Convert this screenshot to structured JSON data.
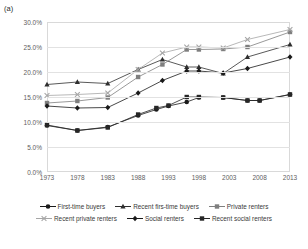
{
  "panel": {
    "label": "(a)"
  },
  "colors": {
    "series_first_time_buyers": "#1a1a1a",
    "series_recent_first_time_buyers": "#2e2e2e",
    "series_private_renters": "#7f7f7f",
    "series_recent_private_renters": "#a6a6a6",
    "series_social_renters": "#1a1a1a",
    "series_recent_social_renters": "#262626",
    "gridline": "#e2e2e2",
    "axis_text": "#5e5e5e",
    "plot_border": "#d9d9d9"
  },
  "chart_data": {
    "type": "line",
    "title": "",
    "subtitle": "",
    "xlabel": "",
    "ylabel": "",
    "grid": true,
    "legend_position": "bottom",
    "xlim": [
      1973,
      2013
    ],
    "ylim": [
      0,
      30
    ],
    "y_tick_labels": [
      "30.0%",
      "25.0%",
      "20.0%",
      "15.0%",
      "10.0%",
      "5.0%",
      "0.0%"
    ],
    "y_ticks": [
      30,
      25,
      20,
      15,
      10,
      5,
      0
    ],
    "x_tick_labels": [
      "1973",
      "1978",
      "1983",
      "1988",
      "1993",
      "1998",
      "2003",
      "2008",
      "2013"
    ],
    "x_ticks": [
      1973,
      1978,
      1983,
      1988,
      1993,
      1998,
      2003,
      2008,
      2013
    ],
    "series": [
      {
        "name": "First-time buyers",
        "marker": "circle",
        "color": "#1a1a1a",
        "x": [
          1973,
          1978,
          1983,
          1988,
          1991,
          1993,
          1996,
          1998,
          2002,
          2006,
          2008,
          2013
        ],
        "values": [
          9.3,
          8.3,
          9.0,
          11.3,
          12.5,
          13.2,
          14.0,
          14.9,
          14.9,
          14.3,
          14.3,
          15.5
        ]
      },
      {
        "name": "Recent firs-time buyers",
        "marker": "triangle",
        "color": "#2e2e2e",
        "x": [
          1973,
          1978,
          1983,
          1988,
          1992,
          1996,
          1998,
          2002,
          2006,
          2013
        ],
        "values": [
          17.5,
          18.0,
          17.7,
          20.5,
          22.5,
          21.0,
          21.0,
          19.7,
          23.0,
          25.5
        ]
      },
      {
        "name": "Private renters",
        "marker": "square",
        "color": "#7f7f7f",
        "x": [
          1973,
          1978,
          1983,
          1988,
          1992,
          1996,
          1998,
          2002,
          2006,
          2013
        ],
        "values": [
          13.8,
          14.2,
          14.9,
          19.0,
          21.5,
          24.5,
          24.5,
          24.6,
          25.0,
          28.0
        ]
      },
      {
        "name": "Recent private renters",
        "marker": "cross",
        "color": "#a6a6a6",
        "x": [
          1973,
          1978,
          1983,
          1988,
          1992,
          1996,
          1998,
          2002,
          2006,
          2013
        ],
        "values": [
          15.3,
          15.5,
          15.8,
          20.5,
          23.8,
          25.0,
          25.0,
          24.8,
          26.5,
          28.5
        ]
      },
      {
        "name": "Social renters",
        "marker": "diamond",
        "color": "#1a1a1a",
        "x": [
          1973,
          1978,
          1983,
          1988,
          1992,
          1996,
          1998,
          2002,
          2006,
          2013
        ],
        "values": [
          13.2,
          12.8,
          12.9,
          15.8,
          18.3,
          20.2,
          20.2,
          19.8,
          20.7,
          23.0
        ]
      },
      {
        "name": "Recent social renters",
        "marker": "square",
        "color": "#262626",
        "x": [
          1973,
          1978,
          1983,
          1988,
          1991,
          1993,
          1996,
          1998,
          2002,
          2006,
          2008,
          2013
        ],
        "values": [
          9.4,
          8.3,
          8.9,
          11.5,
          12.8,
          13.3,
          15.0,
          15.0,
          14.9,
          14.3,
          14.3,
          15.5
        ]
      }
    ]
  },
  "legend": {
    "rows": [
      [
        {
          "label": "First-time buyers",
          "marker": "circle",
          "color": "#1a1a1a"
        },
        {
          "label": "Recent firs-time buyers",
          "marker": "triangle",
          "color": "#2e2e2e"
        },
        {
          "label": "Private renters",
          "marker": "square",
          "color": "#7f7f7f"
        }
      ],
      [
        {
          "label": "Recent private renters",
          "marker": "cross",
          "color": "#a6a6a6"
        },
        {
          "label": "Social renters",
          "marker": "diamond",
          "color": "#1a1a1a"
        },
        {
          "label": "Recent social renters",
          "marker": "square",
          "color": "#262626"
        }
      ]
    ]
  }
}
